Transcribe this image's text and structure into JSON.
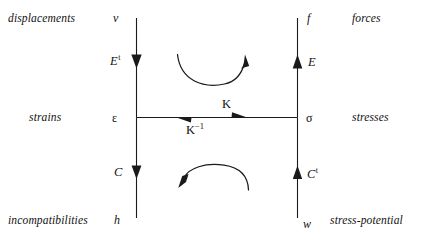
{
  "diagram": {
    "stroke_color": "#1a1a1a",
    "background_color": "#ffffff",
    "corner_words": {
      "top_left": "displacements",
      "top_right": "forces",
      "middle_left": "strains",
      "middle_right": "stresses",
      "bottom_left": "incompatibilities",
      "bottom_right": "stress-potential"
    },
    "nodes": {
      "top_left_var": "v",
      "top_right_var": "f",
      "middle_left_var": "ε",
      "middle_right_var": "σ",
      "bottom_left_var": "h",
      "bottom_right_var": "w"
    },
    "operators": {
      "upper_left": {
        "base": "E",
        "superscript": "t",
        "direction": "down",
        "from": "v",
        "to": "ε"
      },
      "upper_right": {
        "base": "E",
        "superscript": "",
        "direction": "up",
        "from": "σ",
        "to": "f"
      },
      "lower_left": {
        "base": "C",
        "superscript": "",
        "direction": "down",
        "from": "ε",
        "to": "h"
      },
      "lower_right": {
        "base": "C",
        "superscript": "t",
        "direction": "up",
        "from": "w",
        "to": "σ"
      },
      "horizontal_forward": {
        "base": "K",
        "superscript": "",
        "direction": "right",
        "from": "ε",
        "to": "σ"
      },
      "horizontal_inverse": {
        "base": "K",
        "superscript": "−1",
        "direction": "left",
        "from": "σ",
        "to": "ε"
      }
    },
    "loop_arrows": {
      "top": {
        "name": "upper-commutation-loop",
        "direction": "clockwise"
      },
      "bottom": {
        "name": "lower-commutation-loop",
        "direction": "clockwise"
      }
    }
  }
}
